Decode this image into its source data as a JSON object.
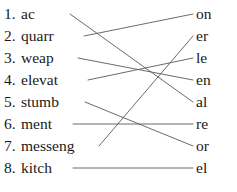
{
  "worksheet": {
    "type": "matching-exercise",
    "instruction": "",
    "width": 237,
    "height": 192,
    "line_color": "#5a5a5a",
    "text_color": "#1a1a1a",
    "background": "#ffffff"
  },
  "left_column": {
    "items": [
      {
        "number": "1.",
        "stem": "ac",
        "y": 14
      },
      {
        "number": "2.",
        "stem": "quarr",
        "y": 36
      },
      {
        "number": "3.",
        "stem": "weap",
        "y": 58
      },
      {
        "number": "4.",
        "stem": "elevat",
        "y": 80
      },
      {
        "number": "5.",
        "stem": "stumb",
        "y": 102
      },
      {
        "number": "6.",
        "stem": "ment",
        "y": 124
      },
      {
        "number": "7.",
        "stem": "messeng",
        "y": 146
      },
      {
        "number": "8.",
        "stem": "kitch",
        "y": 168
      }
    ]
  },
  "right_column": {
    "items": [
      {
        "suffix": "on",
        "y": 14
      },
      {
        "suffix": "er",
        "y": 36
      },
      {
        "suffix": "le",
        "y": 58
      },
      {
        "suffix": "en",
        "y": 80
      },
      {
        "suffix": "al",
        "y": 102
      },
      {
        "suffix": "re",
        "y": 124
      },
      {
        "suffix": "or",
        "y": 146
      },
      {
        "suffix": "el",
        "y": 168
      }
    ]
  },
  "connections": [
    {
      "from_index": 0,
      "to_index": 4,
      "from_label": "ac",
      "to_label": "al",
      "x1": 70,
      "y1": 14,
      "x2": 193,
      "y2": 102
    },
    {
      "from_index": 1,
      "to_index": 0,
      "from_label": "quarr",
      "to_label": "on",
      "x1": 84,
      "y1": 36,
      "x2": 193,
      "y2": 14
    },
    {
      "from_index": 2,
      "to_index": 3,
      "from_index_note": "weap",
      "to_label": "en",
      "from_label": "weap",
      "x1": 78,
      "y1": 58,
      "x2": 193,
      "y2": 80
    },
    {
      "from_index": 3,
      "to_index": 2,
      "from_label": "elevat",
      "to_label": "le",
      "x1": 88,
      "y1": 80,
      "x2": 193,
      "y2": 58
    },
    {
      "from_index": 4,
      "to_index": 6,
      "from_label": "stumb",
      "to_label": "or",
      "x1": 85,
      "y1": 102,
      "x2": 193,
      "y2": 146
    },
    {
      "from_index": 5,
      "to_index": 5,
      "from_label": "ment",
      "to_label": "re",
      "x1": 73,
      "y1": 124,
      "x2": 193,
      "y2": 124
    },
    {
      "from_index": 6,
      "to_index": 1,
      "from_label": "messeng",
      "to_label": "er",
      "x1": 99,
      "y1": 146,
      "x2": 193,
      "y2": 36
    },
    {
      "from_index": 7,
      "to_index": 7,
      "from_label": "kitch",
      "to_label": "el",
      "x1": 73,
      "y1": 168,
      "x2": 193,
      "y2": 168
    }
  ]
}
